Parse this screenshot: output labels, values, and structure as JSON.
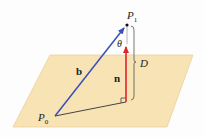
{
  "diagram": {
    "type": "vector-geometry",
    "labels": {
      "p1": "P",
      "p1_sub": "1",
      "p0": "P",
      "p0_sub": "0",
      "b": "b",
      "n": "n",
      "theta": "θ",
      "d": "D"
    },
    "colors": {
      "plane_fill": "#f7e3b4",
      "plane_stroke": "#e9c98a",
      "vector_b": "#3a4fb8",
      "vector_n": "#e0242b",
      "lines": "#444444"
    }
  }
}
